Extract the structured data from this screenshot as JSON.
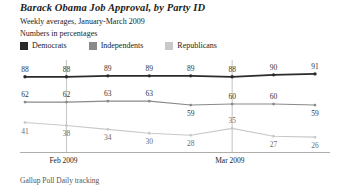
{
  "chart_data": {
    "type": "line",
    "title": "Barack Obama Job Approval, by Party ID",
    "subtitle": "Weekly averages, January-March 2009",
    "subtitle2": "Numbers in percentages",
    "source": "Gallup Poll Daily tracking",
    "xlabel": "",
    "ylabel": "",
    "ylim": [
      20,
      95
    ],
    "grid": "vertical-only",
    "legend_position": "top-left",
    "x": [
      1,
      2,
      3,
      4,
      5,
      6,
      7,
      8
    ],
    "categories": [
      "1",
      "2",
      "3",
      "4",
      "5",
      "6",
      "7",
      "8"
    ],
    "xtick_positions": [
      2,
      6
    ],
    "xtick_labels": [
      "Feb 2009",
      "Mar 2009"
    ],
    "series": [
      {
        "name": "Democrats",
        "color": "#2b2b2b",
        "values": [
          88,
          88,
          89,
          89,
          89,
          88,
          90,
          91
        ],
        "label_positions": [
          "above",
          "above",
          "above",
          "above",
          "above",
          "above",
          "above",
          "above"
        ]
      },
      {
        "name": "Independents",
        "color": "#8a8a8a",
        "values": [
          62,
          62,
          63,
          63,
          59,
          60,
          60,
          59
        ],
        "label_positions": [
          "above",
          "above",
          "above",
          "above",
          "below",
          "above",
          "above",
          "below"
        ]
      },
      {
        "name": "Republicans",
        "color": "#c9c9c9",
        "values": [
          41,
          38,
          34,
          30,
          28,
          35,
          27,
          26
        ],
        "label_positions": [
          "below",
          "below",
          "below",
          "below",
          "below",
          "above",
          "below",
          "below"
        ]
      }
    ]
  },
  "legend": {
    "items": [
      {
        "label": "Democrats",
        "color": "#2b2b2b"
      },
      {
        "label": "Independents",
        "color": "#8a8a8a"
      },
      {
        "label": "Republicans",
        "color": "#c9c9c9"
      }
    ]
  },
  "axis": {
    "tick_labels": [
      "Feb 2009",
      "Mar 2009"
    ]
  }
}
